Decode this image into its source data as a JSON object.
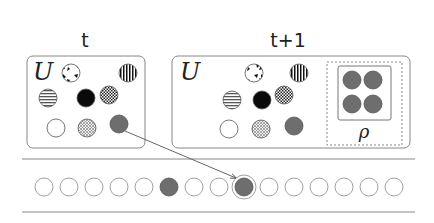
{
  "colors": {
    "stroke": "#777777",
    "box_stroke": "#888888",
    "filled_gray": "#6e6e6e",
    "black": "#0a0a0a",
    "white": "#ffffff",
    "arrow": "#555555"
  },
  "panels": [
    {
      "id": "t",
      "title": "t",
      "set_label": "U",
      "circles": [
        {
          "pattern": "camouflage",
          "cx": 71,
          "cy": 73
        },
        {
          "pattern": "vertical-stripes",
          "cx": 128,
          "cy": 73
        },
        {
          "pattern": "horizontal-stripes",
          "cx": 48,
          "cy": 98
        },
        {
          "pattern": "solid-black",
          "cx": 86,
          "cy": 98
        },
        {
          "pattern": "checkerboard",
          "cx": 109,
          "cy": 95
        },
        {
          "pattern": "empty-white",
          "cx": 56,
          "cy": 128
        },
        {
          "pattern": "crosshatch",
          "cx": 87,
          "cy": 128
        },
        {
          "pattern": "solid-gray",
          "cx": 119,
          "cy": 124
        }
      ]
    },
    {
      "id": "t_plus_1",
      "title": "t+1",
      "set_label": "U",
      "circles": [
        {
          "pattern": "camouflage",
          "cx": 254,
          "cy": 73
        },
        {
          "pattern": "vertical-stripes",
          "cx": 299,
          "cy": 73
        },
        {
          "pattern": "horizontal-stripes",
          "cx": 232,
          "cy": 100
        },
        {
          "pattern": "solid-black",
          "cx": 262,
          "cy": 100
        },
        {
          "pattern": "checkerboard",
          "cx": 284,
          "cy": 95
        },
        {
          "pattern": "empty-white",
          "cx": 229,
          "cy": 129
        },
        {
          "pattern": "crosshatch",
          "cx": 261,
          "cy": 129
        },
        {
          "pattern": "solid-gray",
          "cx": 294,
          "cy": 126
        }
      ],
      "rho_group": {
        "label": "ρ",
        "circles": [
          {
            "pattern": "solid-gray",
            "cx": 352,
            "cy": 80
          },
          {
            "pattern": "solid-gray",
            "cx": 373,
            "cy": 80
          },
          {
            "pattern": "solid-gray",
            "cx": 352,
            "cy": 104
          },
          {
            "pattern": "solid-gray",
            "cx": 373,
            "cy": 104
          }
        ]
      }
    }
  ],
  "sequence": {
    "count": 15,
    "filled_indices": [
      5,
      8
    ],
    "highlighted_index": 8
  },
  "arrow": {
    "from": "panel t, solid-gray circle",
    "to": "sequence item 8"
  }
}
